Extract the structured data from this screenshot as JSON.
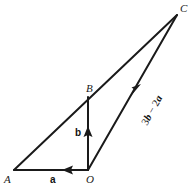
{
  "figure": {
    "type": "vector-diagram",
    "background_color": "#ffffff",
    "stroke_color": "#1a1a1a",
    "stroke_width": 2,
    "canvas": {
      "width": 196,
      "height": 191
    },
    "points": {
      "A": {
        "x": 14,
        "y": 170,
        "label": "A",
        "label_x": 5,
        "label_y": 175
      },
      "O": {
        "x": 88,
        "y": 170,
        "label": "O",
        "label_x": 86,
        "label_y": 175
      },
      "B": {
        "x": 88,
        "y": 97,
        "label": "B",
        "label_x": 86,
        "label_y": 84
      },
      "C": {
        "x": 177,
        "y": 15,
        "label": "C",
        "label_x": 180,
        "label_y": 3
      }
    },
    "segments": [
      {
        "name": "A-to-C",
        "from": "A",
        "to": "C",
        "arrow": false
      },
      {
        "name": "B-to-C",
        "from": "B",
        "to": "C",
        "arrow": false
      },
      {
        "name": "O-to-A",
        "from": "O",
        "to": "A",
        "arrow": true,
        "arrow_at": {
          "x": 67,
          "y": 170
        },
        "arrow_angle": 180
      },
      {
        "name": "O-to-B",
        "from": "O",
        "to": "B",
        "arrow": true,
        "arrow_at": {
          "x": 88,
          "y": 133
        },
        "arrow_angle": -90
      },
      {
        "name": "O-to-C",
        "from": "O",
        "to": "C",
        "arrow": true,
        "arrow_at": {
          "x": 137,
          "y": 89
        },
        "arrow_angle": -61
      }
    ],
    "vector_labels": {
      "a": {
        "text": "a",
        "x": 50,
        "y": 176
      },
      "b": {
        "text": "b",
        "x": 75,
        "y": 128
      }
    },
    "expression_label": {
      "text": "3b − 2a",
      "parts": {
        "coef1": "3",
        "vec1": "b",
        "operator": " − ",
        "coef2": "2",
        "vec2": "a"
      },
      "x": 140,
      "y": 122,
      "rotation_deg": -61
    }
  }
}
